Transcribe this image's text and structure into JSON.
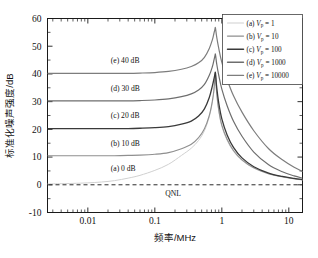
{
  "chart_data": {
    "type": "line",
    "title": "",
    "xlabel": "频率/MHz",
    "ylabel": "标准化噪声强度/dB",
    "xscale": "log",
    "xlim": [
      0.0025,
      16
    ],
    "ylim": [
      -10,
      60
    ],
    "xticks": [
      0.01,
      0.1,
      1,
      10
    ],
    "xticklabels": [
      "0.01",
      "0.1",
      "1",
      "10"
    ],
    "yticks": [
      -10,
      0,
      10,
      20,
      30,
      40,
      50,
      60
    ],
    "yticklabels": [
      "-10",
      "0",
      "10",
      "20",
      "30",
      "40",
      "50",
      "60"
    ],
    "grid": false,
    "legend_position": "top-right",
    "annotations": [
      {
        "text": "(e) 40 dB",
        "x": 0.022,
        "y": 44.0
      },
      {
        "text": "(d) 30 dB",
        "x": 0.022,
        "y": 34.0
      },
      {
        "text": "(c) 20 dB",
        "x": 0.022,
        "y": 24.0
      },
      {
        "text": "(b) 10 dB",
        "x": 0.022,
        "y": 14.0
      },
      {
        "text": "(a) 0 dB",
        "x": 0.022,
        "y": 5.0
      }
    ],
    "reference_line": {
      "label": "QNL",
      "y": 0,
      "style": "dashed"
    },
    "peak_frequency_mhz": 0.8,
    "series": [
      {
        "name": "(a) Vp = 1",
        "key": "a",
        "label_letter": "(a)",
        "symbol": "V",
        "subscript": "p",
        "value": "1",
        "color": "#d0d0d0",
        "width": 1.0,
        "plateau_db": 0.0,
        "peak_db": 40.2,
        "x": [
          0.0025,
          0.004,
          0.006,
          0.01,
          0.016,
          0.025,
          0.04,
          0.06,
          0.1,
          0.16,
          0.25,
          0.35,
          0.45,
          0.55,
          0.65,
          0.72,
          0.76,
          0.79,
          0.8,
          0.81,
          0.84,
          0.9,
          1.0,
          1.2,
          1.5,
          2.0,
          3.0,
          5.0,
          8.0,
          12.0,
          16.0
        ],
        "y": [
          0.3,
          0.4,
          0.5,
          0.7,
          1.0,
          1.5,
          2.4,
          3.4,
          5.2,
          7.4,
          10.6,
          13.2,
          16.0,
          19.5,
          24.5,
          29.5,
          33.5,
          38.5,
          40.2,
          38.0,
          32.5,
          26.5,
          21.0,
          16.0,
          12.0,
          8.8,
          6.0,
          3.9,
          2.8,
          2.1,
          1.7
        ]
      },
      {
        "name": "(b) Vp = 10",
        "key": "b",
        "label_letter": "(b)",
        "symbol": "V",
        "subscript": "p",
        "value": "10",
        "color": "#8f8f8f",
        "width": 1.1,
        "plateau_db": 10.5,
        "peak_db": 40.4,
        "x": [
          0.0025,
          0.004,
          0.006,
          0.01,
          0.016,
          0.025,
          0.04,
          0.06,
          0.1,
          0.16,
          0.25,
          0.35,
          0.45,
          0.55,
          0.65,
          0.72,
          0.76,
          0.79,
          0.8,
          0.81,
          0.84,
          0.9,
          1.0,
          1.2,
          1.5,
          2.0,
          3.0,
          5.0,
          8.0,
          12.0,
          16.0
        ],
        "y": [
          10.5,
          10.5,
          10.5,
          10.5,
          10.5,
          10.5,
          10.6,
          10.7,
          11.0,
          11.6,
          13.0,
          14.6,
          17.0,
          20.2,
          25.0,
          30.0,
          34.0,
          39.0,
          40.4,
          38.5,
          33.0,
          27.0,
          21.5,
          16.4,
          12.3,
          9.0,
          6.1,
          4.0,
          2.9,
          2.2,
          1.8
        ]
      },
      {
        "name": "(c) Vp = 100",
        "key": "c",
        "label_letter": "(c)",
        "symbol": "V",
        "subscript": "p",
        "value": "100",
        "color": "#3a3a3a",
        "width": 1.3,
        "plateau_db": 20.3,
        "peak_db": 40.6,
        "x": [
          0.0025,
          0.004,
          0.006,
          0.01,
          0.016,
          0.025,
          0.04,
          0.06,
          0.1,
          0.16,
          0.25,
          0.35,
          0.45,
          0.55,
          0.65,
          0.72,
          0.76,
          0.79,
          0.8,
          0.81,
          0.84,
          0.9,
          1.0,
          1.2,
          1.5,
          2.0,
          3.0,
          5.0,
          8.0,
          12.0,
          16.0
        ],
        "y": [
          20.3,
          20.3,
          20.3,
          20.3,
          20.3,
          20.3,
          20.3,
          20.4,
          20.6,
          21.0,
          21.9,
          23.0,
          24.8,
          27.4,
          31.5,
          35.5,
          38.0,
          40.0,
          40.6,
          39.5,
          35.0,
          29.5,
          23.8,
          18.0,
          13.4,
          9.7,
          6.5,
          4.2,
          3.0,
          2.3,
          1.9
        ]
      },
      {
        "name": "(d) Vp = 1000",
        "key": "d",
        "label_letter": "(d)",
        "symbol": "V",
        "subscript": "p",
        "value": "1000",
        "color": "#6e6e6e",
        "width": 1.2,
        "plateau_db": 30.3,
        "peak_db": 47.2,
        "x": [
          0.0025,
          0.004,
          0.006,
          0.01,
          0.016,
          0.025,
          0.04,
          0.06,
          0.1,
          0.16,
          0.25,
          0.35,
          0.45,
          0.55,
          0.65,
          0.72,
          0.76,
          0.79,
          0.8,
          0.81,
          0.84,
          0.9,
          1.0,
          1.2,
          1.5,
          2.0,
          3.0,
          5.0,
          8.0,
          12.0,
          16.0
        ],
        "y": [
          30.3,
          30.3,
          30.3,
          30.3,
          30.3,
          30.3,
          30.3,
          30.4,
          30.6,
          31.0,
          31.8,
          32.8,
          34.2,
          36.2,
          39.5,
          42.5,
          44.8,
          46.6,
          47.2,
          46.4,
          43.5,
          39.5,
          34.5,
          28.5,
          22.8,
          17.5,
          11.8,
          7.2,
          4.7,
          3.2,
          2.4
        ]
      },
      {
        "name": "(e) Vp = 10000",
        "key": "e",
        "label_letter": "(e)",
        "symbol": "V",
        "subscript": "p",
        "value": "10000",
        "color": "#7d7d7d",
        "width": 1.2,
        "plateau_db": 40.2,
        "peak_db": 56.8,
        "x": [
          0.0025,
          0.004,
          0.006,
          0.01,
          0.016,
          0.025,
          0.04,
          0.06,
          0.1,
          0.16,
          0.25,
          0.35,
          0.45,
          0.55,
          0.65,
          0.72,
          0.76,
          0.79,
          0.8,
          0.81,
          0.84,
          0.9,
          1.0,
          1.2,
          1.5,
          2.0,
          3.0,
          5.0,
          8.0,
          12.0,
          16.0
        ],
        "y": [
          40.2,
          40.2,
          40.2,
          40.2,
          40.2,
          40.2,
          40.2,
          40.3,
          40.5,
          40.9,
          41.7,
          42.7,
          44.0,
          46.0,
          49.2,
          52.2,
          54.5,
          56.2,
          56.8,
          56.0,
          53.2,
          49.2,
          44.2,
          38.0,
          32.0,
          26.2,
          19.5,
          13.0,
          9.0,
          6.3,
          4.8
        ]
      }
    ]
  }
}
